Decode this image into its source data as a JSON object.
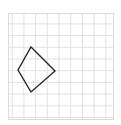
{
  "canvas": {
    "width": 121,
    "height": 125,
    "background_color": "#ffffff"
  },
  "grid": {
    "name": "graph-paper-grid",
    "x": 8,
    "y": 13,
    "width": 105,
    "height": 106,
    "columns": 9,
    "rows": 9,
    "cell_size": 11.7,
    "line_color": "#e2e2e2",
    "border_color": "#dcdcdc",
    "line_width": 1
  },
  "chart_data": {
    "type": "scatter",
    "title": "",
    "subtitle": "",
    "xlabel": "",
    "ylabel": "",
    "grid": true,
    "legend_position": "none",
    "xlim": [
      0,
      9
    ],
    "ylim": [
      0,
      9
    ],
    "xticks": [
      0,
      1,
      2,
      3,
      4,
      5,
      6,
      7,
      8,
      9
    ],
    "yticks": [
      0,
      1,
      2,
      3,
      4,
      5,
      6,
      7,
      8,
      9
    ],
    "xtick_labels": [],
    "ytick_labels": [],
    "annotations": [],
    "series": [
      {
        "name": "kite",
        "shape": "quadrilateral",
        "closed": true,
        "stroke_color": "#2a2a2a",
        "stroke_width": 1.4,
        "fill_color": "none",
        "vertices": [
          {
            "label": "top",
            "x": 31,
            "y": 47
          },
          {
            "label": "right",
            "x": 55,
            "y": 71
          },
          {
            "label": "bottom",
            "x": 31,
            "y": 92
          },
          {
            "label": "left",
            "x": 18,
            "y": 70
          }
        ],
        "points_path": "31,47 55,71 31,92 18,70"
      }
    ]
  }
}
